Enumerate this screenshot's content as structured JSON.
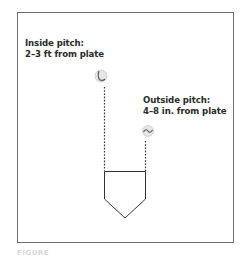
{
  "inside_pitch": {
    "title": "Inside pitch:",
    "detail": "2–3 ft from plate"
  },
  "outside_pitch": {
    "title": "Outside pitch:",
    "detail": "4–8 in. from plate"
  },
  "caption": "FIGURE",
  "colors": {
    "frame": "#6b6b6b",
    "text": "#2a2a2a",
    "plate": "#333333",
    "dotted_line": "#333333",
    "ball_fill": "#e6e6e6",
    "ball_seam": "#555555"
  }
}
